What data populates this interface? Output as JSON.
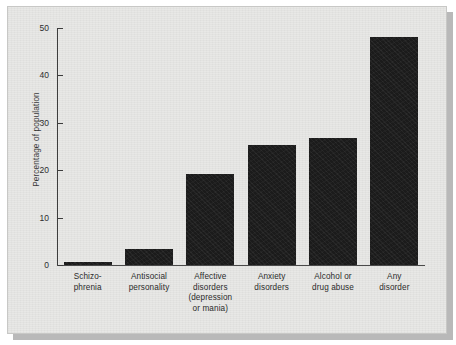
{
  "figure": {
    "background_color": "#e8e8e6",
    "bar_color": "#1b1b1b",
    "axis_color": "#3c3c3c"
  },
  "chart_data": {
    "type": "bar",
    "title": "",
    "xlabel": "",
    "ylabel": "Percentage of population",
    "categories": [
      "Schizo-\nphrenia",
      "Antisocial\npersonality",
      "Affective\ndisorders\n(depression\nor mania)",
      "Anxiety\ndisorders",
      "Alcohol or\ndrug abuse",
      "Any\ndisorder"
    ],
    "values": [
      0.7,
      3.4,
      19.3,
      25.3,
      26.7,
      48.0
    ],
    "ylim": [
      0,
      50
    ],
    "yticks": [
      0,
      10,
      20,
      30,
      40,
      50
    ],
    "ytick_labels": [
      "0",
      "10",
      "20",
      "30",
      "40",
      "50"
    ],
    "grid": false,
    "legend": null
  },
  "axis": {
    "y_label": "Percentage of population",
    "ticks": [
      {
        "value": 50,
        "label": "50"
      },
      {
        "value": 40,
        "label": "40"
      },
      {
        "value": 30,
        "label": "30"
      },
      {
        "value": 20,
        "label": "20"
      },
      {
        "value": 10,
        "label": "10"
      },
      {
        "value": 0,
        "label": "0"
      }
    ]
  },
  "bars": [
    {
      "label": "Schizo-\nphrenia",
      "line1": "Schizo-",
      "line2": "phrenia",
      "line3": "",
      "line4": "",
      "value": 0.7
    },
    {
      "label": "Antisocial\npersonality",
      "line1": "Antisocial",
      "line2": "personality",
      "line3": "",
      "line4": "",
      "value": 3.4
    },
    {
      "label": "Affective\ndisorders\n(depression\nor mania)",
      "line1": "Affective",
      "line2": "disorders",
      "line3": "(depression",
      "line4": "or mania)",
      "value": 19.3
    },
    {
      "label": "Anxiety\ndisorders",
      "line1": "Anxiety",
      "line2": "disorders",
      "line3": "",
      "line4": "",
      "value": 25.3
    },
    {
      "label": "Alcohol or\ndrug abuse",
      "line1": "Alcohol or",
      "line2": "drug abuse",
      "line3": "",
      "line4": "",
      "value": 26.7
    },
    {
      "label": "Any\ndisorder",
      "line1": "Any",
      "line2": "disorder",
      "line3": "",
      "line4": "",
      "value": 48.0
    }
  ]
}
